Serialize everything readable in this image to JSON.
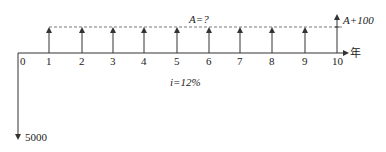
{
  "diagram": {
    "type": "cash-flow-diagram",
    "axis_unit": "年",
    "origin_label": "0",
    "periods": [
      "1",
      "2",
      "3",
      "4",
      "5",
      "6",
      "7",
      "8",
      "9",
      "10"
    ],
    "annuity_label": "A=?",
    "final_extra_label": "A+100",
    "interest_label": "i=12%",
    "initial_outflow_label": "5000"
  }
}
